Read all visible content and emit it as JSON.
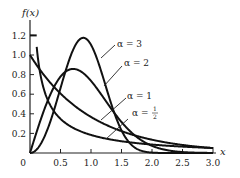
{
  "chart_data": {
    "type": "line",
    "title": "",
    "xlabel": "x",
    "ylabel": "f(x)",
    "xlim": [
      0,
      3.0
    ],
    "ylim": [
      0,
      1.2
    ],
    "grid": false,
    "legend_position": "inline-annotations",
    "x_ticks": [
      "0.5",
      "1.0",
      "1.5",
      "2.0",
      "2.5",
      "3.0"
    ],
    "y_ticks": [
      "0.2",
      "0.4",
      "0.6",
      "0.8",
      "1.0",
      "1.2"
    ],
    "origin_label": "0",
    "series": [
      {
        "name": "α = 3",
        "label_alpha": "α = 3",
        "x": [
          0,
          0.2,
          0.4,
          0.6,
          0.8,
          0.874,
          1.0,
          1.2,
          1.4,
          1.6,
          1.8,
          2.0,
          2.5,
          3.0
        ],
        "values": [
          0,
          0.12,
          0.45,
          0.87,
          1.16,
          1.17,
          1.1,
          0.77,
          0.38,
          0.13,
          0.03,
          0.0,
          0.0,
          0.0
        ]
      },
      {
        "name": "α = 2",
        "label_alpha": "α = 2",
        "x": [
          0,
          0.2,
          0.4,
          0.6,
          0.707,
          0.8,
          1.0,
          1.2,
          1.4,
          1.6,
          1.8,
          2.0,
          2.5,
          3.0
        ],
        "values": [
          0,
          0.38,
          0.68,
          0.84,
          0.86,
          0.84,
          0.74,
          0.57,
          0.39,
          0.25,
          0.14,
          0.07,
          0.005,
          0.0
        ]
      },
      {
        "name": "α = 1",
        "label_alpha": "α = 1",
        "x": [
          0,
          0.2,
          0.4,
          0.6,
          0.8,
          1.0,
          1.2,
          1.4,
          1.6,
          1.8,
          2.0,
          2.5,
          3.0
        ],
        "values": [
          1.0,
          0.82,
          0.67,
          0.55,
          0.45,
          0.37,
          0.3,
          0.25,
          0.2,
          0.17,
          0.14,
          0.08,
          0.05
        ]
      },
      {
        "name": "α = 1/2",
        "label_alpha": "α = ",
        "label_frac_num": "1",
        "label_frac_den": "2",
        "x": [
          0.11,
          0.15,
          0.2,
          0.3,
          0.4,
          0.6,
          0.8,
          1.0,
          1.2,
          1.4,
          1.6,
          1.8,
          2.0,
          2.5,
          3.0
        ],
        "values": [
          1.2,
          0.87,
          0.72,
          0.53,
          0.42,
          0.3,
          0.23,
          0.18,
          0.15,
          0.13,
          0.11,
          0.09,
          0.08,
          0.06,
          0.05
        ]
      }
    ]
  },
  "labels": {
    "y_axis": "f(x)",
    "x_axis": "x",
    "origin": "0",
    "alpha3": "α = 3",
    "alpha2": "α = 2",
    "alpha1": "α = 1",
    "alpha_half_prefix": "α = ",
    "alpha_half_num": "1",
    "alpha_half_den": "2"
  }
}
